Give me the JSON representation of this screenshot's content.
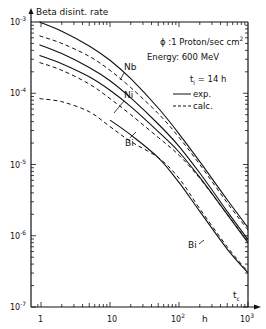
{
  "chart_data": {
    "type": "line",
    "title": "",
    "ylabel": "Beta  disint. rate",
    "xlabel": "h",
    "x_axis_symbol": "t_c",
    "xscale": "log",
    "yscale": "log",
    "xlim": [
      0.87,
      1000
    ],
    "ylim": [
      1e-07,
      0.001
    ],
    "x_ticks": [
      {
        "value": 1,
        "label": "1"
      },
      {
        "value": 10,
        "label": "10"
      },
      {
        "value": 100,
        "label": "10",
        "exp": "2"
      },
      {
        "value": 1000,
        "label": "10",
        "exp": "3"
      }
    ],
    "y_ticks": [
      {
        "value": 0.001,
        "label": "10",
        "exp": "-3"
      },
      {
        "value": 0.0001,
        "label": "10",
        "exp": "-4"
      },
      {
        "value": 1e-05,
        "label": "10",
        "exp": "-5"
      },
      {
        "value": 1e-06,
        "label": "10",
        "exp": "-6"
      },
      {
        "value": 1e-07,
        "label": "10",
        "exp": "-7"
      }
    ],
    "grid": false,
    "annotations": {
      "flux": "ϕ :1 Proton/sec cm",
      "flux_exp": "2",
      "energy": "Energy: 600 MeV",
      "irradiation": "t",
      "irradiation_sub": "i",
      "irradiation_value": " = 14 h"
    },
    "legend": [
      {
        "label": "exp.",
        "style": "solid"
      },
      {
        "label": "calc.",
        "style": "dashed"
      }
    ],
    "series": [
      {
        "name": "Nb exp.",
        "style": "solid",
        "label": "Nb",
        "x": [
          0.95,
          2,
          5,
          10,
          20,
          50,
          100,
          200,
          500,
          1000
        ],
        "y": [
          0.001,
          0.00074,
          0.00046,
          0.00029,
          0.00016,
          6.2e-05,
          2.7e-05,
          1.1e-05,
          3.2e-06,
          1.3e-06
        ]
      },
      {
        "name": "Nb calc.",
        "style": "dashed",
        "x": [
          0.95,
          2,
          5,
          10,
          20,
          50,
          100,
          200,
          500,
          1000
        ],
        "y": [
          0.00064,
          0.0005,
          0.00033,
          0.00021,
          0.00012,
          5.2e-05,
          2.4e-05,
          1e-05,
          2.9e-06,
          1.2e-06
        ]
      },
      {
        "name": "Ni exp. (upper)",
        "style": "solid",
        "label": "Ni",
        "x": [
          0.95,
          2,
          5,
          10,
          20,
          50,
          100,
          200,
          500,
          1000
        ],
        "y": [
          0.00048,
          0.00036,
          0.00023,
          0.00015,
          8.6e-05,
          3.7e-05,
          1.8e-05,
          7.6e-06,
          2.2e-06,
          8.8e-07
        ]
      },
      {
        "name": "Ni exp. (lower)",
        "style": "solid",
        "x": [
          0.95,
          2,
          5,
          10,
          20,
          50,
          100,
          200,
          500,
          1000
        ],
        "y": [
          0.00034,
          0.00026,
          0.00017,
          0.00011,
          6.5e-05,
          2.9e-05,
          1.5e-05,
          6.6e-06,
          2e-06,
          8e-07
        ]
      },
      {
        "name": "Ni calc.",
        "style": "dashed",
        "x": [
          0.95,
          2,
          5,
          10,
          20,
          50,
          100,
          200,
          500,
          1000
        ],
        "y": [
          0.00027,
          0.00021,
          0.000135,
          8.4e-05,
          5e-05,
          2.4e-05,
          1.35e-05,
          6.4e-06,
          2e-06,
          8.2e-07
        ]
      },
      {
        "name": "Bi exp.",
        "style": "solid",
        "label": "Bi",
        "x": [
          10,
          20,
          50,
          100,
          200,
          500,
          1000
        ],
        "y": [
          4.2e-05,
          2.6e-05,
          1.25e-05,
          5.6e-06,
          2.2e-06,
          6.5e-07,
          3e-07
        ]
      },
      {
        "name": "Bi calc.",
        "style": "dashed",
        "x": [
          0.95,
          2,
          5,
          10,
          20,
          50,
          100,
          200,
          500,
          1000
        ],
        "y": [
          8.4e-05,
          7.6e-05,
          5.5e-05,
          3.4e-05,
          2.1e-05,
          1.25e-05,
          6.4e-06,
          2.4e-06,
          7e-07,
          3.1e-07
        ]
      }
    ]
  }
}
